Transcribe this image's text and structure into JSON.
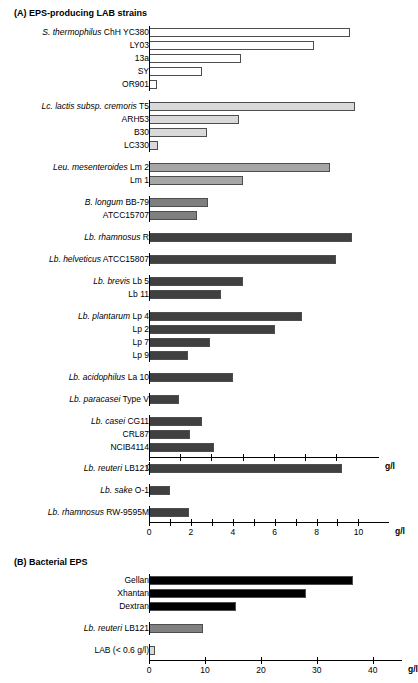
{
  "panels": [
    {
      "id": "A",
      "title": "(A) EPS-producing LAB strains"
    },
    {
      "id": "B",
      "title": "(B) Bacterial EPS"
    }
  ],
  "axis_unit": "g/l",
  "colors": {
    "streptococcus": "#ffffff",
    "lactococcus": "#d9d9d9",
    "leuconostoc": "#a6a6a6",
    "bifidobacterium": "#7f7f7f",
    "lactobacillus": "#404040",
    "eps_commercial": "#000000",
    "eps_reuteri": "#808080",
    "eps_lab": "#d9d9d9",
    "outline": "#4d4d4d"
  },
  "chart_data": [
    {
      "type": "bar",
      "orientation": "horizontal",
      "title": "(A) EPS-producing LAB strains",
      "xlabel": "g/l",
      "ylabel": "",
      "xlim": [
        0,
        0.68
      ],
      "ticks": [
        0,
        0.1,
        0.2,
        0.3,
        0.4,
        0.5,
        0.6
      ],
      "tick_labels": [
        "0",
        "0.1",
        "0.2",
        "0.3",
        "0.4",
        "0.5",
        "0.6"
      ],
      "grid": false,
      "legend": "none",
      "groups": [
        {
          "species": "S. thermophilus",
          "color_key": "streptococcus",
          "bars": [
            {
              "species": "S. thermophilus",
              "strain": "ChH YC380",
              "value": 0.645
            },
            {
              "species": "",
              "strain": "LY03",
              "value": 0.53
            },
            {
              "species": "",
              "strain": "13a",
              "value": 0.295
            },
            {
              "species": "",
              "strain": "SY",
              "value": 0.17
            },
            {
              "species": "",
              "strain": "OR901",
              "value": 0.025
            }
          ]
        },
        {
          "species": "Lc. lactis subsp. cremoris",
          "color_key": "lactococcus",
          "bars": [
            {
              "species": "Lc. lactis subsp. cremoris",
              "strain": "T5",
              "value": 0.66
            },
            {
              "species": "",
              "strain": "ARH53",
              "value": 0.29
            },
            {
              "species": "",
              "strain": "B30",
              "value": 0.185
            },
            {
              "species": "",
              "strain": "LC330",
              "value": 0.03
            }
          ]
        },
        {
          "species": "Leu. mesenteroides",
          "color_key": "leuconostoc",
          "bars": [
            {
              "species": "Leu. mesenteroides",
              "strain": "Lm 2",
              "value": 0.58
            },
            {
              "species": "",
              "strain": "Lm 1",
              "value": 0.3
            }
          ]
        },
        {
          "species": "B. longum",
          "color_key": "bifidobacterium",
          "bars": [
            {
              "species": "B. longum",
              "strain": "BB-79",
              "value": 0.19
            },
            {
              "species": "",
              "strain": "ATCC15707",
              "value": 0.155
            }
          ]
        },
        {
          "species": "Lb. rhamnosus",
          "color_key": "lactobacillus",
          "bars": [
            {
              "species": "Lb. rhamnosus",
              "strain": "R",
              "value": 0.65
            }
          ]
        },
        {
          "species": "Lb. helveticus",
          "color_key": "lactobacillus",
          "bars": [
            {
              "species": "Lb. helveticus",
              "strain": "ATCC15807",
              "value": 0.6
            }
          ]
        },
        {
          "species": "Lb. brevis",
          "color_key": "lactobacillus",
          "bars": [
            {
              "species": "Lb. brevis",
              "strain": "Lb 5",
              "value": 0.3
            },
            {
              "species": "",
              "strain": "Lb 11",
              "value": 0.23
            }
          ]
        },
        {
          "species": "Lb. plantarum",
          "color_key": "lactobacillus",
          "bars": [
            {
              "species": "Lb. plantarum",
              "strain": "Lp 4",
              "value": 0.49
            },
            {
              "species": "",
              "strain": "Lp 2",
              "value": 0.405
            },
            {
              "species": "",
              "strain": "Lp 7",
              "value": 0.195
            },
            {
              "species": "",
              "strain": "Lp 9",
              "value": 0.125
            }
          ]
        },
        {
          "species": "Lb. acidophilus",
          "color_key": "lactobacillus",
          "bars": [
            {
              "species": "Lb. acidophilus",
              "strain": "La 10",
              "value": 0.27
            }
          ]
        },
        {
          "species": "Lb. paracasei",
          "color_key": "lactobacillus",
          "bars": [
            {
              "species": "Lb. paracasei",
              "strain": "Type V",
              "value": 0.095
            }
          ]
        },
        {
          "species": "Lb. casei",
          "color_key": "lactobacillus",
          "bars": [
            {
              "species": "Lb. casei",
              "strain": "CG11",
              "value": 0.17
            },
            {
              "species": "",
              "strain": "CRL87",
              "value": 0.13
            },
            {
              "species": "",
              "strain": "NCIB4114",
              "value": 0.21
            }
          ]
        }
      ]
    },
    {
      "type": "bar",
      "orientation": "horizontal",
      "title": "",
      "xlabel": "g/l",
      "ylabel": "",
      "xlim": [
        0,
        10.6
      ],
      "ticks": [
        0,
        1,
        2,
        3,
        4,
        5,
        6,
        7,
        8,
        9,
        10
      ],
      "tick_labels": [
        "0",
        "",
        "2",
        "",
        "4",
        "",
        "6",
        "",
        "8",
        "",
        "10"
      ],
      "grid": false,
      "legend": "none",
      "groups": [
        {
          "species": "Lb. reuteri",
          "color_key": "lactobacillus",
          "bars": [
            {
              "species": "Lb. reuteri",
              "strain": "LB121",
              "value": 9.2
            }
          ]
        },
        {
          "species": "Lb. sake",
          "color_key": "lactobacillus",
          "bars": [
            {
              "species": "Lb. sake",
              "strain": "O-1",
              "value": 1.0
            }
          ]
        },
        {
          "species": "Lb. rhamnosus",
          "color_key": "lactobacillus",
          "bars": [
            {
              "species": "Lb. rhamnosus",
              "strain": "RW-9595M",
              "value": 1.9
            }
          ]
        }
      ]
    },
    {
      "type": "bar",
      "orientation": "horizontal",
      "title": "(B) Bacterial EPS",
      "xlabel": "g/l",
      "ylabel": "",
      "xlim": [
        0,
        42
      ],
      "ticks": [
        0,
        10,
        20,
        30,
        40
      ],
      "tick_labels": [
        "0",
        "10",
        "20",
        "30",
        "40"
      ],
      "grid": false,
      "legend": "none",
      "groups": [
        {
          "species": "",
          "color_key": "eps_commercial",
          "bars": [
            {
              "species": "",
              "strain": "Gellan",
              "value": 36.5
            },
            {
              "species": "",
              "strain": "Xhantan",
              "value": 28.0
            },
            {
              "species": "",
              "strain": "Dextran",
              "value": 15.5
            }
          ]
        },
        {
          "species": "Lb. reuteri",
          "color_key": "eps_reuteri",
          "bars": [
            {
              "species": "Lb. reuteri",
              "strain": "LB121",
              "value": 9.7
            }
          ]
        },
        {
          "species": "",
          "color_key": "eps_lab",
          "bars": [
            {
              "species": "",
              "strain": "LAB (< 0.6 g/l)",
              "value": 1.0
            }
          ]
        }
      ]
    }
  ]
}
